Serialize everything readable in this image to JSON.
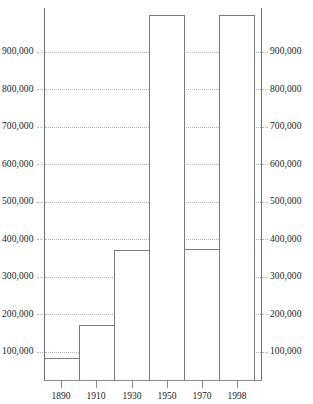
{
  "top_strip": {
    "text": "",
    "note": "faint cut-off row of text at the very top edge of the screenshot"
  },
  "colors": {
    "bar_outline": "#7a7a7a",
    "bar_fill": "#ffffff",
    "axis": "#6f6f6f",
    "gridline": "#b4b4b4",
    "text": "#222222",
    "background": "#ffffff"
  },
  "axes": {
    "y_left_labels": [
      "900,000",
      "800,000",
      "700,000",
      "600,000",
      "500,000",
      "400,000",
      "300,000",
      "200,000",
      "100,000"
    ],
    "y_right_labels": [
      "900,000",
      "800,000",
      "700,000",
      "600,000",
      "500,000",
      "400,000",
      "300,000",
      "200,000",
      "100,000"
    ],
    "x_labels": [
      "1890",
      "1910",
      "1930",
      "1950",
      "1970",
      "1998"
    ]
  },
  "chart_data": {
    "type": "bar",
    "title": "",
    "subtitle": "",
    "xlabel": "",
    "ylabel": "",
    "categories": [
      "1890",
      "1910",
      "1930",
      "1950",
      "1970",
      "1998"
    ],
    "values": [
      12000,
      28000,
      62000,
      150000,
      350000,
      975000
    ],
    "ylim": [
      0,
      1000000
    ],
    "ytick_values": [
      100000,
      200000,
      300000,
      400000,
      500000,
      600000,
      700000,
      800000,
      900000
    ],
    "ytick_labels": [
      "100,000",
      "200,000",
      "300,000",
      "400,000",
      "500,000",
      "600,000",
      "700,000",
      "800,000",
      "900,000"
    ],
    "xtick_labels": [
      "1890",
      "1910",
      "1930",
      "1950",
      "1970",
      "1998"
    ],
    "grid": true,
    "grid_style": "dotted-horizontal",
    "legend": "none",
    "bar_style": "contiguous-histogram-outline",
    "mirrored_y_axis": true,
    "annotations": []
  }
}
